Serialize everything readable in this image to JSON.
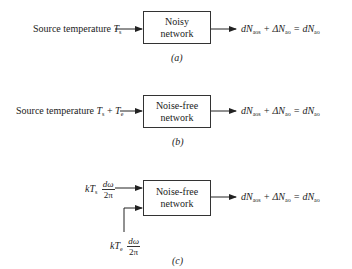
{
  "panels": [
    {
      "id": "a",
      "caption": "(a)",
      "input_label": "Source temperature ",
      "input_symbol": "T",
      "input_sub": "s",
      "box_line1": "Noisy",
      "box_line2": "network",
      "output": {
        "t1": "dN",
        "s1": "aos",
        "op1": " + ΔN",
        "s2": "ao",
        "op2": " = dN",
        "s3": "ao"
      }
    },
    {
      "id": "b",
      "caption": "(b)",
      "input_label": "Source temperature ",
      "input_symbol": "T",
      "input_sub": "s",
      "input_plus": " + ",
      "input_symbol2": "T",
      "input_sub2": "e",
      "box_line1": "Noise-free",
      "box_line2": "network",
      "output": {
        "t1": "dN",
        "s1": "aos",
        "op1": " + ΔN",
        "s2": "ao",
        "op2": " = dN",
        "s3": "ao"
      }
    },
    {
      "id": "c",
      "caption": "(c)",
      "input1": {
        "k": "kT",
        "sub": "s",
        "num": "dω",
        "den": "2π"
      },
      "input2": {
        "k": "kT",
        "sub": "e",
        "num": "dω",
        "den": "2π"
      },
      "box_line1": "Noise-free",
      "box_line2": "network",
      "output": {
        "t1": "dN",
        "s1": "aos",
        "op1": " + ΔN",
        "s2": "ao",
        "op2": " = dN",
        "s3": "ao"
      }
    }
  ]
}
